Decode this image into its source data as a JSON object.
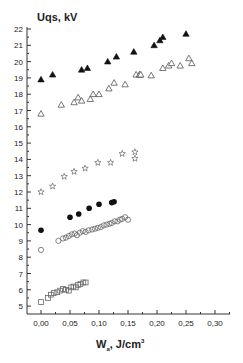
{
  "chart_data": {
    "type": "scatter",
    "title": "",
    "ylabel": "Uqs, kV",
    "xlabel_main": "W",
    "xlabel_sub": "a",
    "xlabel_rest": ", J/cm",
    "xlabel_sup": "3",
    "xlim": [
      -0.02,
      0.32
    ],
    "ylim": [
      4.6,
      22.1
    ],
    "x_ticks": [
      0.0,
      0.05,
      0.1,
      0.15,
      0.2,
      0.25,
      0.3
    ],
    "x_tick_labels": [
      "0,00",
      "0,05",
      "0,10",
      "0,15",
      "0,20",
      "0,25",
      "0,30"
    ],
    "y_ticks": [
      5,
      6,
      7,
      8,
      9,
      10,
      11,
      12,
      13,
      14,
      15,
      16,
      17,
      18,
      19,
      20,
      21,
      22
    ],
    "y_tick_labels": [
      "5",
      "6",
      "7",
      "8",
      "9",
      "10",
      "11",
      "12",
      "13",
      "14",
      "15",
      "16",
      "17",
      "18",
      "19",
      "20",
      "21",
      "22"
    ],
    "grid": false,
    "legend": "none",
    "series": [
      {
        "name": "filled-triangles",
        "marker": "triangle-filled",
        "points": [
          [
            0.0,
            18.9
          ],
          [
            0.02,
            19.2
          ],
          [
            0.07,
            19.5
          ],
          [
            0.08,
            19.6
          ],
          [
            0.115,
            20.0
          ],
          [
            0.13,
            20.3
          ],
          [
            0.16,
            20.6
          ],
          [
            0.195,
            21.0
          ],
          [
            0.205,
            21.3
          ],
          [
            0.21,
            21.5
          ],
          [
            0.25,
            21.7
          ]
        ]
      },
      {
        "name": "open-triangles",
        "marker": "triangle-open",
        "points": [
          [
            0.0,
            16.8
          ],
          [
            0.035,
            17.35
          ],
          [
            0.057,
            17.5
          ],
          [
            0.064,
            17.8
          ],
          [
            0.07,
            17.6
          ],
          [
            0.085,
            17.7
          ],
          [
            0.09,
            18.0
          ],
          [
            0.1,
            18.0
          ],
          [
            0.117,
            18.35
          ],
          [
            0.126,
            18.7
          ],
          [
            0.145,
            18.6
          ],
          [
            0.164,
            19.2
          ],
          [
            0.17,
            19.2
          ],
          [
            0.17,
            19.2
          ],
          [
            0.172,
            19.2
          ],
          [
            0.19,
            19.15
          ],
          [
            0.21,
            19.6
          ],
          [
            0.22,
            19.75
          ],
          [
            0.225,
            19.9
          ],
          [
            0.24,
            19.75
          ],
          [
            0.255,
            20.2
          ],
          [
            0.26,
            19.9
          ]
        ]
      },
      {
        "name": "stars",
        "marker": "star-open",
        "points": [
          [
            0.0,
            12.0
          ],
          [
            0.02,
            12.35
          ],
          [
            0.04,
            12.95
          ],
          [
            0.057,
            13.25
          ],
          [
            0.076,
            13.45
          ],
          [
            0.098,
            13.8
          ],
          [
            0.12,
            13.8
          ],
          [
            0.14,
            14.35
          ],
          [
            0.162,
            14.45
          ],
          [
            0.162,
            14.05
          ]
        ]
      },
      {
        "name": "filled-circles",
        "marker": "circle-filled",
        "points": [
          [
            0.0,
            9.65
          ],
          [
            0.05,
            10.45
          ],
          [
            0.065,
            10.65
          ],
          [
            0.083,
            11.0
          ],
          [
            0.1,
            11.25
          ],
          [
            0.122,
            11.35
          ],
          [
            0.126,
            11.4
          ]
        ]
      },
      {
        "name": "open-circles",
        "marker": "circle-open",
        "points": [
          [
            0.0,
            8.45
          ],
          [
            0.03,
            9.0
          ],
          [
            0.038,
            9.15
          ],
          [
            0.043,
            9.2
          ],
          [
            0.048,
            9.3
          ],
          [
            0.053,
            9.4
          ],
          [
            0.058,
            9.45
          ],
          [
            0.062,
            9.35
          ],
          [
            0.067,
            9.5
          ],
          [
            0.072,
            9.6
          ],
          [
            0.077,
            9.55
          ],
          [
            0.082,
            9.65
          ],
          [
            0.088,
            9.7
          ],
          [
            0.093,
            9.75
          ],
          [
            0.098,
            9.8
          ],
          [
            0.103,
            9.85
          ],
          [
            0.108,
            9.95
          ],
          [
            0.113,
            10.0
          ],
          [
            0.118,
            10.05
          ],
          [
            0.122,
            10.1
          ],
          [
            0.127,
            10.2
          ],
          [
            0.132,
            10.2
          ],
          [
            0.136,
            10.3
          ],
          [
            0.14,
            10.35
          ],
          [
            0.145,
            10.45
          ],
          [
            0.15,
            10.3
          ]
        ]
      },
      {
        "name": "open-squares",
        "marker": "square-open",
        "points": [
          [
            0.0,
            5.25
          ],
          [
            0.012,
            5.5
          ],
          [
            0.017,
            5.7
          ],
          [
            0.022,
            5.8
          ],
          [
            0.028,
            5.85
          ],
          [
            0.033,
            5.95
          ],
          [
            0.038,
            6.05
          ],
          [
            0.043,
            6.0
          ],
          [
            0.048,
            5.95
          ],
          [
            0.052,
            6.15
          ],
          [
            0.056,
            6.2
          ],
          [
            0.06,
            6.15
          ],
          [
            0.064,
            6.3
          ],
          [
            0.068,
            6.35
          ],
          [
            0.073,
            6.45
          ],
          [
            0.077,
            6.45
          ]
        ]
      }
    ]
  }
}
